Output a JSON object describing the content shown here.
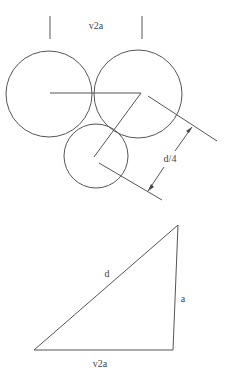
{
  "diagram": {
    "colors": {
      "line": "#555555",
      "text": "#444444",
      "background": "#ffffff"
    },
    "top_figure": {
      "width_label": "v2a",
      "dimension_label": "d/4",
      "circles": [
        {
          "name": "left",
          "cx": 49,
          "cy": 94,
          "r": 43
        },
        {
          "name": "right",
          "cx": 138,
          "cy": 94,
          "r": 44
        },
        {
          "name": "bottom",
          "cx": 96,
          "cy": 156,
          "r": 32
        }
      ]
    },
    "bottom_figure": {
      "hypotenuse_label": "d",
      "side_label": "a",
      "base_label": "v2a"
    }
  }
}
